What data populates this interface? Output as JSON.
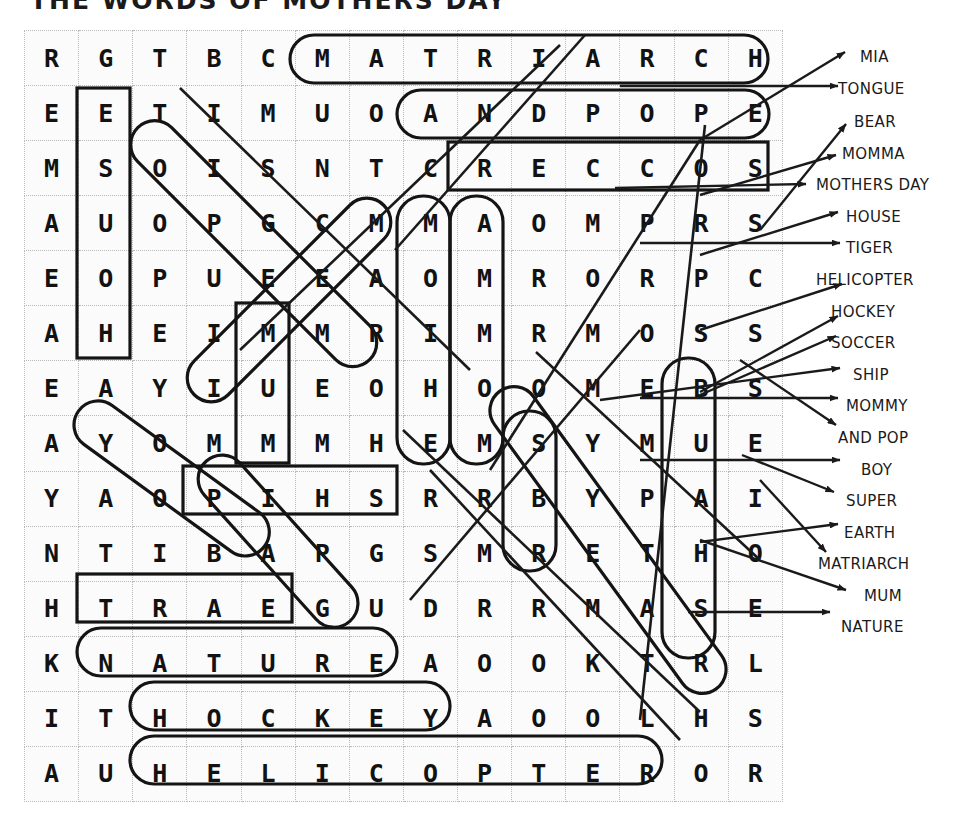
{
  "title": "THE WORDS OF MOTHERS DAY",
  "puzzle": {
    "rows": 14,
    "cols": 14,
    "grid": [
      [
        "R",
        "G",
        "T",
        "B",
        "C",
        "M",
        "A",
        "T",
        "R",
        "I",
        "A",
        "R",
        "C",
        "H"
      ],
      [
        "E",
        "E",
        "T",
        "I",
        "M",
        "U",
        "O",
        "A",
        "N",
        "D",
        "P",
        "O",
        "P",
        "E"
      ],
      [
        "M",
        "S",
        "O",
        "I",
        "S",
        "N",
        "T",
        "C",
        "R",
        "E",
        "C",
        "C",
        "O",
        "S"
      ],
      [
        "A",
        "U",
        "O",
        "P",
        "G",
        "C",
        "M",
        "M",
        "A",
        "O",
        "M",
        "P",
        "R",
        "S"
      ],
      [
        "E",
        "O",
        "P",
        "U",
        "E",
        "E",
        "A",
        "O",
        "M",
        "R",
        "O",
        "R",
        "P",
        "C"
      ],
      [
        "A",
        "H",
        "E",
        "I",
        "M",
        "M",
        "R",
        "I",
        "M",
        "R",
        "M",
        "O",
        "S",
        "S"
      ],
      [
        "E",
        "A",
        "Y",
        "I",
        "U",
        "E",
        "O",
        "H",
        "O",
        "O",
        "M",
        "E",
        "B",
        "S"
      ],
      [
        "A",
        "Y",
        "O",
        "M",
        "M",
        "M",
        "H",
        "E",
        "M",
        "S",
        "Y",
        "M",
        "U",
        "E"
      ],
      [
        "Y",
        "A",
        "O",
        "P",
        "I",
        "H",
        "S",
        "R",
        "R",
        "B",
        "Y",
        "P",
        "A",
        "I"
      ],
      [
        "N",
        "T",
        "I",
        "B",
        "A",
        "P",
        "G",
        "S",
        "M",
        "R",
        "E",
        "T",
        "H",
        "O"
      ],
      [
        "H",
        "T",
        "R",
        "A",
        "E",
        "G",
        "U",
        "D",
        "R",
        "R",
        "M",
        "A",
        "S",
        "E"
      ],
      [
        "K",
        "N",
        "A",
        "T",
        "U",
        "R",
        "E",
        "A",
        "O",
        "O",
        "K",
        "T",
        "R",
        "L"
      ],
      [
        "I",
        "T",
        "H",
        "O",
        "C",
        "K",
        "E",
        "Y",
        "A",
        "O",
        "O",
        "L",
        "H",
        "S"
      ],
      [
        "A",
        "U",
        "H",
        "E",
        "L",
        "I",
        "C",
        "O",
        "P",
        "T",
        "E",
        "R",
        "O",
        "R"
      ]
    ]
  },
  "wordlist": {
    "label": "word-list",
    "items": [
      {
        "text": "MIA",
        "top": 14,
        "left": 44
      },
      {
        "text": "TONGUE",
        "top": 46,
        "left": 22
      },
      {
        "text": "BEAR",
        "top": 79,
        "left": 38
      },
      {
        "text": "MOMMA",
        "top": 111,
        "left": 26
      },
      {
        "text": "MOTHERS DAY",
        "top": 142,
        "left": 0
      },
      {
        "text": "HOUSE",
        "top": 174,
        "left": 30
      },
      {
        "text": "TIGER",
        "top": 205,
        "left": 30
      },
      {
        "text": "HELICOPTER",
        "top": 237,
        "left": 0
      },
      {
        "text": "HOCKEY",
        "top": 269,
        "left": 15
      },
      {
        "text": "SOCCER",
        "top": 300,
        "left": 15
      },
      {
        "text": "SHIP",
        "top": 332,
        "left": 37
      },
      {
        "text": "MOMMY",
        "top": 363,
        "left": 30
      },
      {
        "text": "AND POP",
        "top": 395,
        "left": 22
      },
      {
        "text": "BOY",
        "top": 427,
        "left": 45
      },
      {
        "text": "SUPER",
        "top": 458,
        "left": 30
      },
      {
        "text": "EARTH",
        "top": 490,
        "left": 28
      },
      {
        "text": "MATRIARCH",
        "top": 521,
        "left": 2
      },
      {
        "text": "MUM",
        "top": 553,
        "left": 48
      },
      {
        "text": "NATURE",
        "top": 584,
        "left": 25
      }
    ]
  },
  "colors": {
    "ink": "#1a1a1a",
    "grid_line": "#b9b9b9",
    "cell_bg": "#fbfbfb",
    "highlight_stroke": "#141414"
  }
}
